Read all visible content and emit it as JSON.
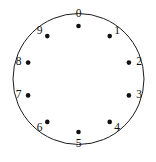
{
  "diagram": {
    "name": "circle-node-diagram",
    "background_color": "#ffffff",
    "stroke_color": "#1a1a1a",
    "dot_color": "#111111",
    "label_color": "#111111",
    "outer_circle": {
      "cx": 78.5,
      "cy": 79,
      "r": 65.5
    },
    "dot_radius": 2.3,
    "node_ring_radius": 53,
    "nodes": [
      {
        "label": "0",
        "angle_deg": 0,
        "dot_x": 78.5,
        "dot_y": 26.0,
        "label_x": 78.5,
        "label_y": 14.5,
        "anchor": "middle"
      },
      {
        "label": "1",
        "angle_deg": 36,
        "dot_x": 109.7,
        "dot_y": 36.1,
        "label_x": 117.0,
        "label_y": 31.5,
        "anchor": "middle"
      },
      {
        "label": "2",
        "angle_deg": 72,
        "dot_x": 128.9,
        "dot_y": 62.6,
        "label_x": 139.0,
        "label_y": 62.6,
        "anchor": "middle"
      },
      {
        "label": "3",
        "angle_deg": 108,
        "dot_x": 128.9,
        "dot_y": 95.4,
        "label_x": 139.0,
        "label_y": 95.4,
        "anchor": "middle"
      },
      {
        "label": "4",
        "angle_deg": 144,
        "dot_x": 109.7,
        "dot_y": 121.9,
        "label_x": 117.0,
        "label_y": 128.5,
        "anchor": "middle"
      },
      {
        "label": "5",
        "angle_deg": 180,
        "dot_x": 78.5,
        "dot_y": 132.0,
        "label_x": 78.5,
        "label_y": 144.0,
        "anchor": "middle"
      },
      {
        "label": "6",
        "angle_deg": 216,
        "dot_x": 47.3,
        "dot_y": 121.9,
        "label_x": 39.5,
        "label_y": 128.5,
        "anchor": "middle"
      },
      {
        "label": "7",
        "angle_deg": 252,
        "dot_x": 28.1,
        "dot_y": 95.4,
        "label_x": 18.5,
        "label_y": 95.4,
        "anchor": "middle"
      },
      {
        "label": "8",
        "angle_deg": 288,
        "dot_x": 28.1,
        "dot_y": 62.6,
        "label_x": 18.5,
        "label_y": 62.6,
        "anchor": "middle"
      },
      {
        "label": "9",
        "angle_deg": 324,
        "dot_x": 47.3,
        "dot_y": 36.1,
        "label_x": 39.5,
        "label_y": 31.5,
        "anchor": "middle"
      }
    ]
  },
  "chart_data": {
    "type": "scatter",
    "title": "",
    "xlabel": "",
    "ylabel": "",
    "categories": [
      "0",
      "1",
      "2",
      "3",
      "4",
      "5",
      "6",
      "7",
      "8",
      "9"
    ],
    "values": [
      0,
      36,
      72,
      108,
      144,
      180,
      216,
      252,
      288,
      324
    ],
    "series": [
      {
        "name": "node-angles-degrees-clockwise-from-top",
        "values": [
          0,
          36,
          72,
          108,
          144,
          180,
          216,
          252,
          288,
          324
        ]
      }
    ],
    "grid": false,
    "legend": "none"
  }
}
